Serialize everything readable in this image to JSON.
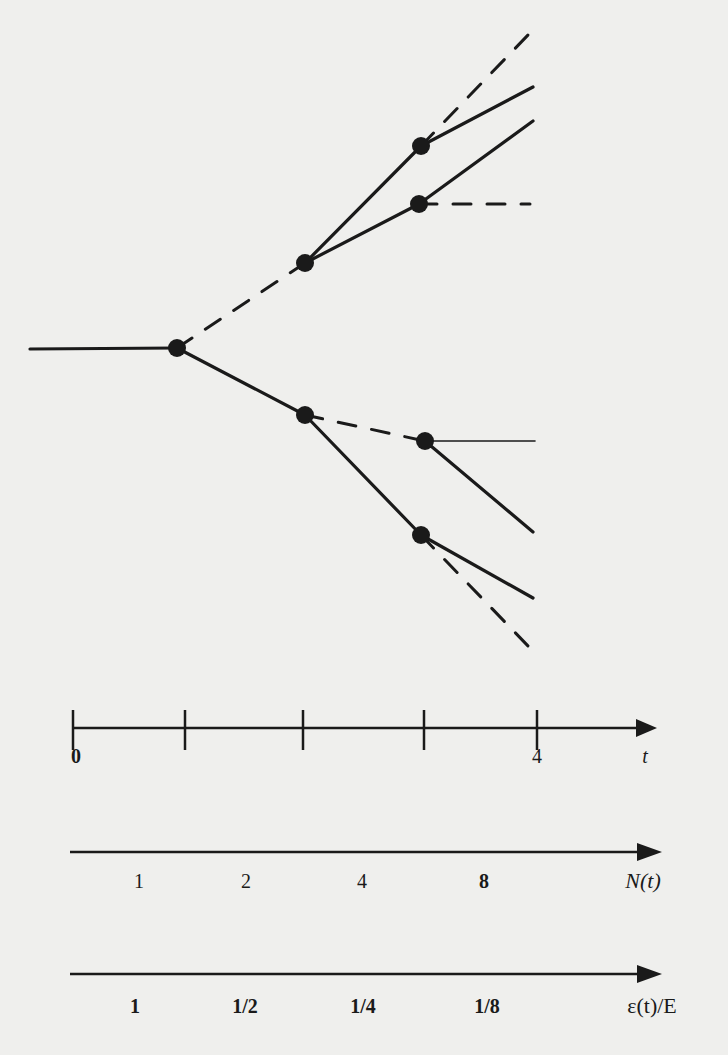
{
  "figure": {
    "type": "branching-tree",
    "colors": {
      "ink": "#1a1a1a",
      "paper": "#efefed"
    }
  },
  "tree": {
    "nodes": [
      {
        "id": "root-split",
        "x": 177,
        "y": 348
      },
      {
        "id": "upper-1",
        "x": 305,
        "y": 263
      },
      {
        "id": "upper-2a",
        "x": 421,
        "y": 146
      },
      {
        "id": "upper-2b",
        "x": 419,
        "y": 204
      },
      {
        "id": "lower-1",
        "x": 305,
        "y": 415
      },
      {
        "id": "lower-2a",
        "x": 425,
        "y": 441
      },
      {
        "id": "lower-2b",
        "x": 421,
        "y": 535
      }
    ],
    "edges": [
      {
        "from": [
          30,
          349
        ],
        "to": [
          177,
          348
        ],
        "style": "solid"
      },
      {
        "from": [
          177,
          348
        ],
        "to": [
          305,
          263
        ],
        "style": "dashed"
      },
      {
        "from": [
          305,
          263
        ],
        "to": [
          421,
          146
        ],
        "style": "solid"
      },
      {
        "from": [
          421,
          146
        ],
        "to": [
          528,
          35
        ],
        "style": "dashed"
      },
      {
        "from": [
          421,
          146
        ],
        "to": [
          533,
          87
        ],
        "style": "solid"
      },
      {
        "from": [
          305,
          263
        ],
        "to": [
          419,
          204
        ],
        "style": "solid"
      },
      {
        "from": [
          419,
          204
        ],
        "to": [
          533,
          121
        ],
        "style": "solid"
      },
      {
        "from": [
          419,
          204
        ],
        "to": [
          530,
          204
        ],
        "style": "dashed"
      },
      {
        "from": [
          177,
          348
        ],
        "to": [
          305,
          415
        ],
        "style": "solid"
      },
      {
        "from": [
          305,
          415
        ],
        "to": [
          425,
          441
        ],
        "style": "dashed"
      },
      {
        "from": [
          425,
          441
        ],
        "to": [
          535,
          441
        ],
        "style": "thin"
      },
      {
        "from": [
          425,
          441
        ],
        "to": [
          533,
          532
        ],
        "style": "solid"
      },
      {
        "from": [
          305,
          415
        ],
        "to": [
          421,
          535
        ],
        "style": "solid"
      },
      {
        "from": [
          421,
          535
        ],
        "to": [
          533,
          598
        ],
        "style": "solid"
      },
      {
        "from": [
          421,
          535
        ],
        "to": [
          530,
          648
        ],
        "style": "dashed"
      }
    ]
  },
  "axes": {
    "time": {
      "label": "t",
      "tick_labels": [
        {
          "text": "0",
          "x": 76
        },
        {
          "text": "4",
          "x": 537
        }
      ],
      "tick_positions": [
        73,
        185,
        303,
        424,
        537
      ]
    },
    "count": {
      "label": "N(t)",
      "interval_labels": [
        {
          "text": "1",
          "x": 139
        },
        {
          "text": "2",
          "x": 246
        },
        {
          "text": "4",
          "x": 362
        },
        {
          "text": "8",
          "x": 484
        }
      ]
    },
    "energy": {
      "label": "ε(t)/E",
      "interval_labels": [
        {
          "text": "1",
          "x": 135
        },
        {
          "text": "1/2",
          "x": 245
        },
        {
          "text": "1/4",
          "x": 363
        },
        {
          "text": "1/8",
          "x": 487
        }
      ]
    }
  }
}
